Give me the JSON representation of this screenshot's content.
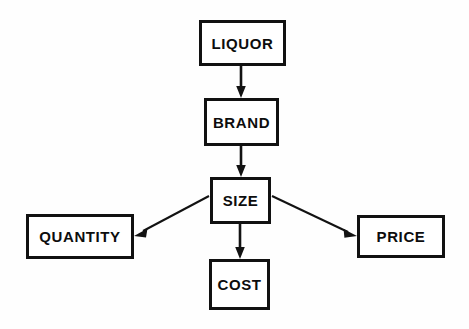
{
  "diagram": {
    "background_color": "#fefefe",
    "line_color": "#121212",
    "box_fill": "#ffffff",
    "nodes": [
      {
        "id": "liquor",
        "label": "LIQUOR"
      },
      {
        "id": "brand",
        "label": "BRAND"
      },
      {
        "id": "size",
        "label": "SIZE"
      },
      {
        "id": "quantity",
        "label": "QUANTITY"
      },
      {
        "id": "price",
        "label": "PRICE"
      },
      {
        "id": "cost",
        "label": "COST"
      }
    ],
    "edges": [
      {
        "id": "liquor-to-brand",
        "from": "LIQUOR",
        "to": "BRAND",
        "style": "vertical-arrow"
      },
      {
        "id": "brand-to-size",
        "from": "BRAND",
        "to": "SIZE",
        "style": "vertical-arrow"
      },
      {
        "id": "size-to-quantity",
        "from": "SIZE",
        "to": "QUANTITY",
        "style": "diagonal-arrow"
      },
      {
        "id": "size-to-price",
        "from": "SIZE",
        "to": "PRICE",
        "style": "diagonal-arrow"
      },
      {
        "id": "size-to-cost",
        "from": "SIZE",
        "to": "COST",
        "style": "vertical-arrow"
      }
    ]
  }
}
